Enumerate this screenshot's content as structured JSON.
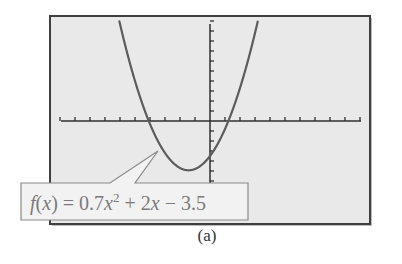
{
  "chart_data": {
    "type": "line",
    "title": "",
    "function": "f(x) = 0.7x^2 + 2x - 3.5",
    "coefficients": {
      "a": 0.7,
      "b": 2,
      "c": -3.5
    },
    "xlim": [
      -10,
      10
    ],
    "ylim": [
      -10,
      10
    ],
    "x_tick_step": 1,
    "y_tick_step": 1,
    "x_tick_labels": [],
    "y_tick_labels": [],
    "grid": false,
    "xlabel": "",
    "ylabel": "",
    "annotations": [
      {
        "text": "f(x) = 0.7x² + 2x − 3.5",
        "points_to": [
          -3.5,
          -3.1
        ]
      }
    ],
    "key_points": {
      "vertex": [
        -1.43,
        -4.93
      ],
      "y_intercept": [
        0,
        -3.5
      ],
      "x_intercepts": [
        -4.08,
        1.23
      ]
    },
    "series": [
      {
        "name": "f(x)",
        "x": [
          -6.05,
          -5,
          -4,
          -3,
          -2,
          -1.43,
          -1,
          0,
          1,
          2,
          3,
          3.19
        ],
        "values": [
          10,
          3.0,
          -0.3,
          -3.2,
          -4.7,
          -4.93,
          -4.8,
          -3.5,
          -0.8,
          3.3,
          8.8,
          10
        ]
      }
    ]
  },
  "figure": {
    "label": {
      "f_part": "f",
      "open_paren": "(",
      "x_var": "x",
      "close_eq": ") = 0.7",
      "x_var2": "x",
      "exponent": "2",
      "rest": " + 2",
      "x_var3": "x",
      "tail": " − 3.5"
    },
    "caption": "(a)"
  },
  "colors": {
    "screen_background": "#e9e9e9",
    "frame_border": "#3f3f3f",
    "curve": "#5c5c5c",
    "axis": "#2f2f2f",
    "label_text": "#7a7a7a",
    "label_border": "#8a8a8a",
    "label_fill": "#f2f2f2"
  }
}
